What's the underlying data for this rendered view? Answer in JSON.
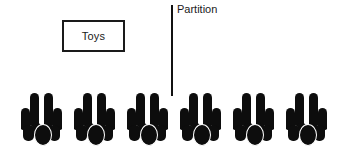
{
  "diagram": {
    "background_color": "#ffffff",
    "ink_color": "#0d0d0d"
  },
  "toys_box": {
    "label": "Toys",
    "border_color": "#1a1a1a",
    "fill_color": "#ffffff"
  },
  "partition": {
    "label": "Partition",
    "line_color": "#111111"
  },
  "figure_groups": [
    {
      "name": "group-1",
      "left_px": 21
    },
    {
      "name": "group-2",
      "left_px": 74
    },
    {
      "name": "group-3",
      "left_px": 127
    },
    {
      "name": "group-4",
      "left_px": 180
    },
    {
      "name": "group-5",
      "left_px": 233
    },
    {
      "name": "group-6",
      "left_px": 286
    }
  ],
  "counts": {
    "group_count": "6"
  }
}
